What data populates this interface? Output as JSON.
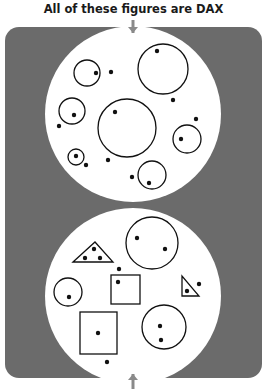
{
  "title": "All of these figures are DAX",
  "colors": {
    "panel": "#6b6b6b",
    "disc": "#ffffff",
    "stroke": "#111111",
    "arrow": "#8a8a8a"
  },
  "panel": {
    "x": 5,
    "y": 27,
    "width": 257,
    "height": 351,
    "radius": 14
  },
  "top_disc": {
    "cx": 133,
    "cy": 114,
    "r": 88,
    "circles": [
      {
        "cx": 87,
        "cy": 73,
        "r": 13,
        "dots": [
          [
            96,
            73
          ]
        ]
      },
      {
        "cx": 163,
        "cy": 69,
        "r": 25,
        "dots": [
          [
            157,
            51
          ]
        ]
      },
      {
        "cx": 72,
        "cy": 111,
        "r": 13,
        "dots": [
          [
            74,
            115
          ]
        ]
      },
      {
        "cx": 127,
        "cy": 128,
        "r": 29,
        "dots": [
          [
            115,
            112
          ]
        ]
      },
      {
        "cx": 187,
        "cy": 139,
        "r": 14,
        "dots": [
          [
            181,
            139
          ]
        ]
      },
      {
        "cx": 76,
        "cy": 157,
        "r": 8,
        "dots": [
          [
            76,
            156
          ]
        ]
      },
      {
        "cx": 152,
        "cy": 175,
        "r": 14,
        "dots": [
          [
            149,
            183
          ]
        ]
      }
    ],
    "loose_dots": [
      [
        111,
        72
      ],
      [
        173,
        100
      ],
      [
        59,
        126
      ],
      [
        196,
        119
      ],
      [
        86,
        165
      ],
      [
        108,
        160
      ],
      [
        132,
        177
      ]
    ]
  },
  "bottom_disc": {
    "cx": 133,
    "cy": 296,
    "r": 88,
    "circles": [
      {
        "cx": 152,
        "cy": 243,
        "r": 26,
        "dots": [
          [
            137,
            238
          ],
          [
            165,
            249
          ]
        ]
      },
      {
        "cx": 68,
        "cy": 292,
        "r": 14,
        "dots": [
          [
            69,
            297
          ]
        ]
      },
      {
        "cx": 164,
        "cy": 327,
        "r": 22,
        "dots": [
          [
            160,
            326
          ],
          [
            161,
            340
          ]
        ]
      }
    ],
    "triangles": [
      {
        "points": "73,262 95,242 113,262",
        "dots": [
          [
            94,
            249
          ],
          [
            85,
            258
          ],
          [
            100,
            258
          ]
        ]
      },
      {
        "points": "182,276 182,296 199,296",
        "dots": [
          [
            187,
            291
          ]
        ]
      }
    ],
    "squares": [
      {
        "x": 111,
        "y": 275,
        "w": 29,
        "h": 29,
        "dots": [
          [
            118,
            282
          ]
        ]
      },
      {
        "x": 80,
        "y": 312,
        "w": 37,
        "h": 42,
        "dots": [
          [
            98,
            333
          ]
        ]
      }
    ],
    "loose_dots": [
      [
        119,
        269
      ],
      [
        199,
        284
      ],
      [
        107,
        362
      ]
    ]
  },
  "arrows": [
    {
      "name": "top-arrow",
      "x": 133,
      "y1": 20,
      "y2": 33,
      "direction": "down"
    },
    {
      "name": "bottom-arrow",
      "x": 133,
      "y1": 389,
      "y2": 374,
      "direction": "up"
    }
  ]
}
